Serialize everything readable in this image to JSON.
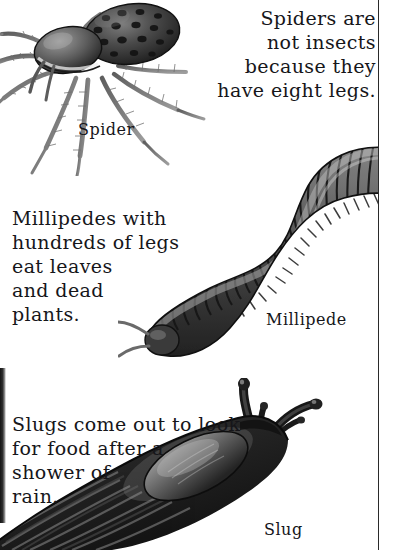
{
  "page": {
    "background_color": "#ffffff",
    "ink_color": "#16161a",
    "width": 398,
    "height": 550
  },
  "rules": {
    "right_margin_rule_color": "#2a2a2a"
  },
  "entries": [
    {
      "id": "spider",
      "caption": "Spiders are\nnot insects\nbecause they\nhave eight legs.",
      "label": "Spider",
      "illustration": "spider-illustration"
    },
    {
      "id": "millipede",
      "caption": "Millipedes with\nhundreds of legs\neat leaves\nand dead\nplants.",
      "label": "Millipede",
      "illustration": "millipede-illustration"
    },
    {
      "id": "slug",
      "caption": "Slugs come out to look\nfor food after a\nshower of\nrain.",
      "label": "Slug",
      "illustration": "slug-illustration"
    }
  ]
}
